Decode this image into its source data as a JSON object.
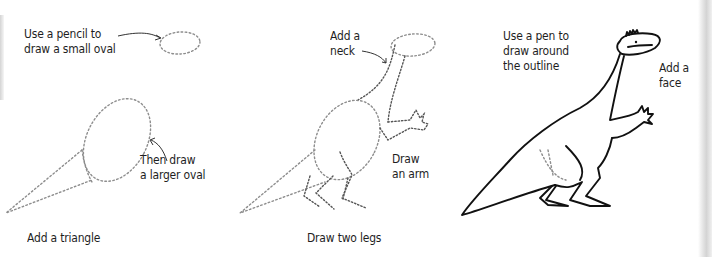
{
  "colors": {
    "background": "#ffffff",
    "text": "#1e1e1e",
    "pencil_guide": "#8d8d8d",
    "pencil_dark": "#555555",
    "pen_ink": "#111111"
  },
  "steps": [
    {
      "caption": "Add a triangle",
      "annotations": [
        {
          "id": "small-oval",
          "text": "Use a pencil to\ndraw a small oval",
          "icon": "arrow-right-icon"
        },
        {
          "id": "larger-oval",
          "text": "Then draw\na larger oval",
          "icon": "arrow-up-left-icon"
        }
      ]
    },
    {
      "caption": "Draw two legs",
      "annotations": [
        {
          "id": "neck",
          "text": "Add a\nneck",
          "icon": "arrow-right-down-icon"
        },
        {
          "id": "arm",
          "text": "Draw\nan arm"
        }
      ]
    },
    {
      "caption": "",
      "annotations": [
        {
          "id": "pen-outline",
          "text": "Use a pen to\ndraw around\nthe outline"
        },
        {
          "id": "face",
          "text": "Add a\nface"
        }
      ]
    }
  ]
}
